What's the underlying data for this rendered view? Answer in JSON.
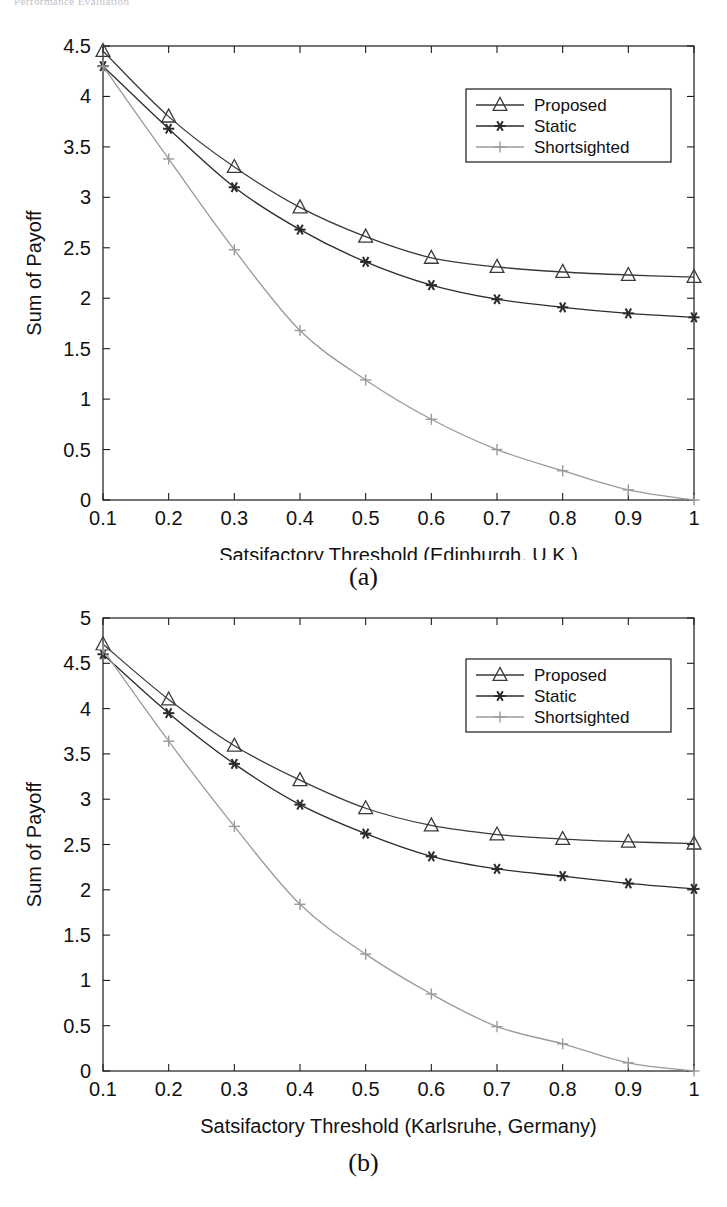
{
  "page": {
    "header_text": "Performance Evaluation"
  },
  "figures": [
    {
      "id": "figure-a",
      "caption": "(a)",
      "legend": {
        "items": [
          {
            "label": "Proposed",
            "marker": "triangle-marker",
            "color": "#3a3a3a"
          },
          {
            "label": "Static",
            "marker": "asterisk-marker",
            "color": "#2b2b2b"
          },
          {
            "label": "Shortsighted",
            "marker": "plus-marker",
            "color": "#9a9a9a"
          }
        ]
      },
      "chart_data": {
        "type": "line",
        "title": "",
        "xlabel": "Satsifactory Threshold (Edinburgh, U.K.)",
        "ylabel": "Sum of Payoff",
        "x": [
          0.1,
          0.2,
          0.3,
          0.4,
          0.5,
          0.6,
          0.7,
          0.8,
          0.9,
          1
        ],
        "xticklabels": [
          "0.1",
          "0.2",
          "0.3",
          "0.4",
          "0.5",
          "0.6",
          "0.7",
          "0.8",
          "0.9",
          "1"
        ],
        "yticks": [
          0,
          0.5,
          1,
          1.5,
          2,
          2.5,
          3,
          3.5,
          4,
          4.5
        ],
        "yticklabels": [
          "0",
          "0.5",
          "1",
          "1.5",
          "2",
          "2.5",
          "3",
          "3.5",
          "4",
          "4.5"
        ],
        "xlim": [
          0.1,
          1
        ],
        "ylim": [
          0,
          4.5
        ],
        "grid": false,
        "legend_position": "top-right",
        "series": [
          {
            "name": "Proposed",
            "marker": "triangle",
            "color": "#3a3a3a",
            "values": [
              4.45,
              3.8,
              3.3,
              2.9,
              2.61,
              2.4,
              2.31,
              2.26,
              2.23,
              2.21
            ]
          },
          {
            "name": "Static",
            "marker": "asterisk",
            "color": "#2b2b2b",
            "values": [
              4.3,
              3.68,
              3.1,
              2.68,
              2.36,
              2.13,
              1.99,
              1.91,
              1.85,
              1.81
            ]
          },
          {
            "name": "Shortsighted",
            "marker": "plus",
            "color": "#9a9a9a",
            "values": [
              4.3,
              3.38,
              2.48,
              1.68,
              1.19,
              0.8,
              0.5,
              0.29,
              0.1,
              0.0
            ]
          }
        ]
      }
    },
    {
      "id": "figure-b",
      "caption": "(b)",
      "legend": {
        "items": [
          {
            "label": "Proposed",
            "marker": "triangle-marker",
            "color": "#3a3a3a"
          },
          {
            "label": "Static",
            "marker": "asterisk-marker",
            "color": "#2b2b2b"
          },
          {
            "label": "Shortsighted",
            "marker": "plus-marker",
            "color": "#9a9a9a"
          }
        ]
      },
      "chart_data": {
        "type": "line",
        "title": "",
        "xlabel": "Satsifactory Threshold (Karlsruhe, Germany)",
        "ylabel": "Sum of Payoff",
        "x": [
          0.1,
          0.2,
          0.3,
          0.4,
          0.5,
          0.6,
          0.7,
          0.8,
          0.9,
          1
        ],
        "xticklabels": [
          "0.1",
          "0.2",
          "0.3",
          "0.4",
          "0.5",
          "0.6",
          "0.7",
          "0.8",
          "0.9",
          "1"
        ],
        "yticks": [
          0,
          0.5,
          1,
          1.5,
          2,
          2.5,
          3,
          3.5,
          4,
          4.5,
          5
        ],
        "yticklabels": [
          "0",
          "0.5",
          "1",
          "1.5",
          "2",
          "2.5",
          "3",
          "3.5",
          "4",
          "4.5",
          "5"
        ],
        "xlim": [
          0.1,
          1
        ],
        "ylim": [
          0,
          5
        ],
        "grid": false,
        "legend_position": "top-right",
        "series": [
          {
            "name": "Proposed",
            "marker": "triangle",
            "color": "#3a3a3a",
            "values": [
              4.71,
              4.1,
              3.59,
              3.21,
              2.9,
              2.71,
              2.61,
              2.56,
              2.53,
              2.51
            ]
          },
          {
            "name": "Static",
            "marker": "asterisk",
            "color": "#2b2b2b",
            "values": [
              4.6,
              3.95,
              3.39,
              2.94,
              2.62,
              2.37,
              2.23,
              2.15,
              2.07,
              2.01
            ]
          },
          {
            "name": "Shortsighted",
            "marker": "plus",
            "color": "#9a9a9a",
            "values": [
              4.65,
              3.64,
              2.7,
              1.84,
              1.29,
              0.85,
              0.49,
              0.3,
              0.09,
              0.0
            ]
          }
        ]
      }
    }
  ]
}
